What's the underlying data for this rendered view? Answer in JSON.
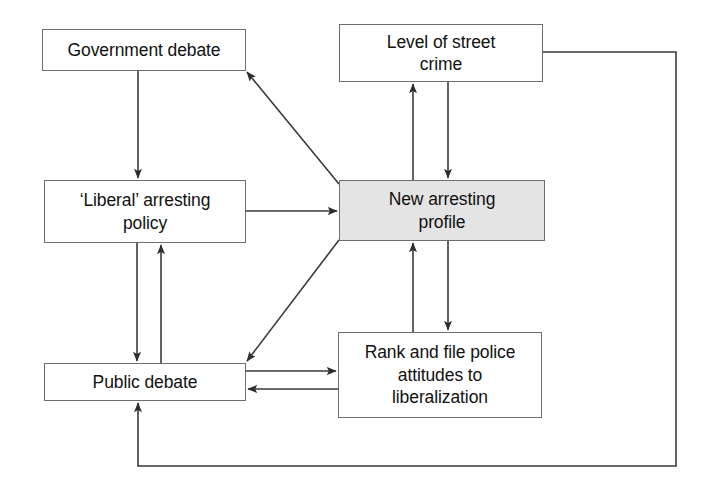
{
  "diagram": {
    "type": "flow-diagram",
    "width": 706,
    "height": 490,
    "background_color": "#ffffff",
    "line_color": "#3a3a3a",
    "box_border_color": "#6e6e6e",
    "shaded_box_color": "#e4e4e4",
    "text_color": "#111111",
    "nodes": [
      {
        "id": "government-debate",
        "label": "Government debate",
        "x": 42,
        "y": 29,
        "width": 204,
        "height": 42,
        "shaded": false
      },
      {
        "id": "liberal-arresting-policy",
        "label": "‘Liberal’ arresting\npolicy",
        "x": 44,
        "y": 180,
        "width": 202,
        "height": 63,
        "shaded": false
      },
      {
        "id": "public-debate",
        "label": "Public debate",
        "x": 44,
        "y": 363,
        "width": 202,
        "height": 38,
        "shaded": false
      },
      {
        "id": "level-of-street-crime",
        "label": "Level of street\ncrime",
        "x": 339,
        "y": 24,
        "width": 204,
        "height": 58,
        "shaded": false
      },
      {
        "id": "new-arresting-profile",
        "label": "New arresting\nprofile",
        "x": 339,
        "y": 180,
        "width": 206,
        "height": 61,
        "shaded": true
      },
      {
        "id": "rank-and-file-police",
        "label": "Rank and file police\nattitudes to\nliberalization",
        "x": 338,
        "y": 332,
        "width": 204,
        "height": 86,
        "shaded": false
      }
    ],
    "edges": [
      {
        "id": "government-debate-to-liberal-policy",
        "from": "government-debate",
        "to": "liberal-arresting-policy",
        "shape": "vertical",
        "direction": "down"
      },
      {
        "id": "liberal-policy-to-new-profile",
        "from": "liberal-arresting-policy",
        "to": "new-arresting-profile",
        "shape": "horizontal",
        "direction": "right"
      },
      {
        "id": "new-profile-to-government-debate",
        "from": "new-arresting-profile",
        "to": "government-debate",
        "shape": "diagonal",
        "direction": "up-left"
      },
      {
        "id": "new-profile-to-public-debate",
        "from": "new-arresting-profile",
        "to": "public-debate",
        "shape": "diagonal",
        "direction": "down-left"
      },
      {
        "id": "liberal-policy-to-public-debate",
        "from": "liberal-arresting-policy",
        "to": "public-debate",
        "shape": "vertical",
        "direction": "down"
      },
      {
        "id": "public-debate-to-liberal-policy",
        "from": "public-debate",
        "to": "liberal-arresting-policy",
        "shape": "vertical",
        "direction": "up"
      },
      {
        "id": "new-profile-to-level-of-street-crime",
        "from": "new-arresting-profile",
        "to": "level-of-street-crime",
        "shape": "vertical",
        "direction": "up"
      },
      {
        "id": "level-of-street-crime-to-new-profile",
        "from": "level-of-street-crime",
        "to": "new-arresting-profile",
        "shape": "vertical",
        "direction": "down"
      },
      {
        "id": "new-profile-to-rank-and-file",
        "from": "new-arresting-profile",
        "to": "rank-and-file-police",
        "shape": "vertical",
        "direction": "down"
      },
      {
        "id": "rank-and-file-to-new-profile",
        "from": "rank-and-file-police",
        "to": "new-arresting-profile",
        "shape": "vertical",
        "direction": "up"
      },
      {
        "id": "public-debate-to-rank-and-file",
        "from": "public-debate",
        "to": "rank-and-file-police",
        "shape": "horizontal",
        "direction": "right"
      },
      {
        "id": "rank-and-file-to-public-debate",
        "from": "rank-and-file-police",
        "to": "public-debate",
        "shape": "horizontal",
        "direction": "left"
      },
      {
        "id": "level-of-street-crime-to-public-debate-feedback",
        "from": "level-of-street-crime",
        "to": "public-debate",
        "shape": "orthogonal-loop",
        "direction": "up"
      }
    ]
  }
}
